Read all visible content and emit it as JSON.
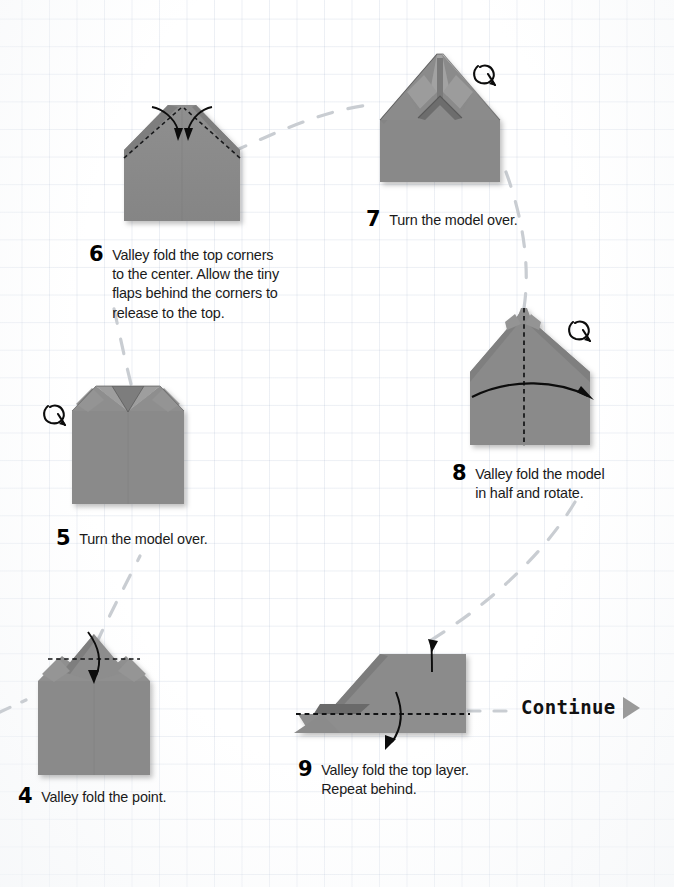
{
  "page": {
    "background": "#ffffff",
    "grid_color": "#c8d2e0",
    "paper_fill": "#8a8a8a",
    "paper_shadow": "#6f6f6f",
    "ink_color": "#111111",
    "trail_color": "#c9cdd2",
    "continue_arrow_color": "#9a9a9a"
  },
  "steps": [
    {
      "number": "4",
      "text": "Valley fold the point.",
      "diagram": "shirt-with-collar-point-up",
      "has_turnover_symbol": false
    },
    {
      "number": "5",
      "text": "Turn the model over.",
      "diagram": "shirt-with-open-collar",
      "has_turnover_symbol": true
    },
    {
      "number": "6",
      "text": "Valley fold the top corners\nto the center. Allow the tiny\nflaps behind the corners to\nrelease to the top.",
      "diagram": "pentagon-house-with-corner-folds",
      "has_turnover_symbol": false
    },
    {
      "number": "7",
      "text": "Turn the model over.",
      "diagram": "peaked-roof-house",
      "has_turnover_symbol": true
    },
    {
      "number": "8",
      "text": "Valley fold the model\nin half and rotate.",
      "diagram": "dome-house-with-center-fold",
      "has_turnover_symbol": true
    },
    {
      "number": "9",
      "text": "Valley fold the top layer.\nRepeat behind.",
      "diagram": "rotated-flat-form",
      "has_turnover_symbol": false
    }
  ],
  "continue": {
    "label": "Continue",
    "arrow": "triangle-right-icon"
  },
  "symbols": {
    "turnover": "turn-over-loop-arrow-icon",
    "valley_fold_line": "dashed-line",
    "fold_arrow": "curved-arrow-icon"
  }
}
